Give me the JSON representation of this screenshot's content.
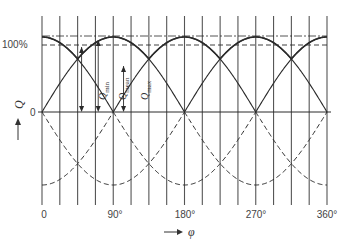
{
  "diagram": {
    "type": "waveform-diagram",
    "y_axis": {
      "symbol": "Q",
      "arrow": "up",
      "labels": {
        "top": "100%",
        "zero": "0"
      }
    },
    "x_axis": {
      "symbol": "φ",
      "arrow": "right",
      "tick_labels": [
        "0",
        "90°",
        "180°",
        "270°",
        "360°"
      ],
      "tick_values": [
        0,
        90,
        180,
        270,
        360
      ],
      "range": [
        0,
        360
      ],
      "grid_step_deg": 22.5
    },
    "annotations": {
      "q_min": {
        "base": "Q",
        "sub": "min"
      },
      "q_mean": {
        "base": "Q",
        "sub": "mean"
      },
      "q_max": {
        "base": "Q",
        "sub": "max"
      }
    },
    "levels": {
      "top_percent": 100,
      "min_percent": 87,
      "zero_percent": 0
    },
    "period_deg": 90,
    "colors": {
      "ink": "#2a2a2a",
      "grid": "#555555",
      "background": "#ffffff"
    }
  }
}
